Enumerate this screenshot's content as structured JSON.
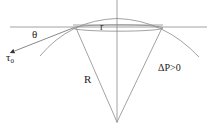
{
  "diagram": {
    "title": "",
    "labels": {
      "theta": "θ",
      "small_r": "r",
      "big_R": "R",
      "pressure": "ΔP>0",
      "tau_symbol": "τ",
      "tau_subscript": "0"
    },
    "elements": [
      {
        "type": "horizontal-line",
        "description": "baseline / contact plane"
      },
      {
        "type": "vertical-line",
        "description": "symmetry axis"
      },
      {
        "type": "arc",
        "description": "spherical cap of radius R"
      },
      {
        "type": "ellipse",
        "description": "contact circle of radius r (perspective)"
      },
      {
        "type": "radius-lines",
        "description": "two radii from contact edge to center"
      },
      {
        "type": "tangent-arrow",
        "description": "surface tension vector τ0 at contact angle θ"
      }
    ],
    "colors": {
      "line": "#8a8a8a",
      "text": "#222222",
      "background": "#ffffff"
    }
  }
}
